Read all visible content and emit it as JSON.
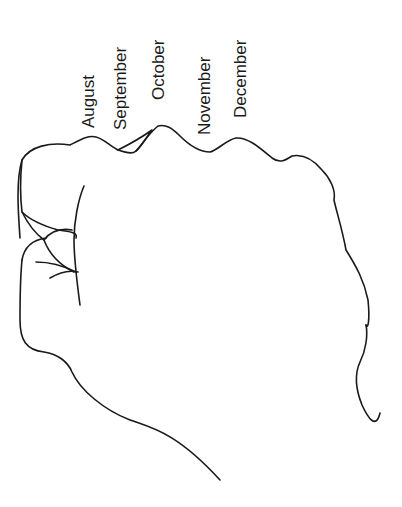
{
  "diagram": {
    "stroke_color": "#1a1a1a",
    "background": "#ffffff",
    "labels": [
      {
        "id": "august",
        "text": "August"
      },
      {
        "id": "september",
        "text": "September"
      },
      {
        "id": "october",
        "text": "October"
      },
      {
        "id": "november",
        "text": "November"
      },
      {
        "id": "december",
        "text": "December"
      }
    ]
  }
}
